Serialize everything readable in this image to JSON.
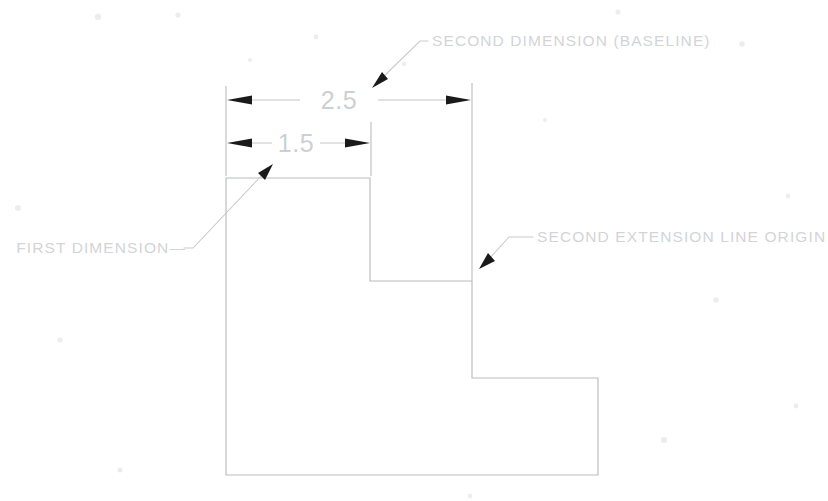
{
  "drawing": {
    "title": "Baseline dimensioning example",
    "background_color": "#ffffff",
    "line_color": "#b9bcbe",
    "text_color": "#d2d5d7",
    "arrow_color": "#1a1a1a",
    "dimensions": [
      {
        "id": "first-dimension",
        "value": "1.5",
        "orientation": "horizontal"
      },
      {
        "id": "second-dimension",
        "value": "2.5",
        "orientation": "horizontal"
      }
    ],
    "annotations": [
      {
        "id": "second-dimension-note",
        "text": "SECOND DIMENSION (BASELINE)"
      },
      {
        "id": "first-dimension-note",
        "text": "FIRST DIMENSION—"
      },
      {
        "id": "second-extension-note",
        "text": "SECOND EXTENSION LINE ORIGIN"
      }
    ],
    "geometry": {
      "outline_points": "226,178 370,178 370,281 472,281 472,378 598,378 598,475 226,475",
      "description": "Stepped L-shaped profile with two risers"
    }
  }
}
